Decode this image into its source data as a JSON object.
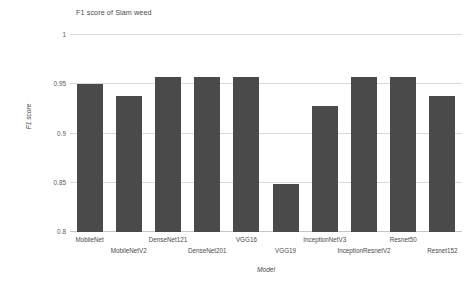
{
  "chart_data": {
    "type": "bar",
    "title": "F1 score of Siam weed",
    "xlabel": "Model",
    "ylabel": "F1 score",
    "ylim": [
      0.8,
      1
    ],
    "yticks": [
      "0.8",
      "0.85",
      "0.9",
      "0.95",
      "1"
    ],
    "ytick_values": [
      0.8,
      0.85,
      0.9,
      0.95,
      1
    ],
    "grid": true,
    "legend": "none",
    "bar_color": "#4a4a4a",
    "background_color": "#ffffff",
    "gridline_color": "#d8d8d8",
    "categories": [
      "MobileNet",
      "MobileNetV2",
      "DenseNet121",
      "DenseNet201",
      "VGG16",
      "VGG19",
      "InceptionNetV3",
      "InceptionResnetV2",
      "Resnet50",
      "Resnet152"
    ],
    "values": [
      0.95,
      0.938,
      0.957,
      0.957,
      0.957,
      0.849,
      0.928,
      0.957,
      0.957,
      0.938
    ]
  }
}
